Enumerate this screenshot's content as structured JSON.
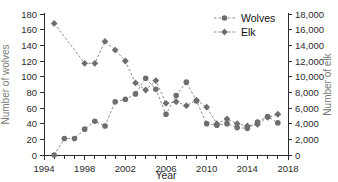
{
  "chart_data": {
    "type": "line",
    "title": "",
    "xlabel": "Year",
    "ylabel": "Number of wolves",
    "y2label": "Number of elk",
    "xlim": [
      1994,
      2018
    ],
    "ylim": [
      0,
      180
    ],
    "y2lim": [
      0,
      18000
    ],
    "xticks": [
      1994,
      1998,
      2002,
      2006,
      2010,
      2014,
      2018
    ],
    "xtick_labels": [
      "1994",
      "1998",
      "2002",
      "2006",
      "2010",
      "2014",
      "2018"
    ],
    "x_minor_tick_interval": 1,
    "yticks": [
      0,
      20,
      40,
      60,
      80,
      100,
      120,
      140,
      160,
      180
    ],
    "ytick_labels": [
      "0",
      "20",
      "40",
      "60",
      "80",
      "100",
      "120",
      "140",
      "160",
      "180"
    ],
    "y2ticks": [
      0,
      2000,
      4000,
      6000,
      8000,
      10000,
      12000,
      14000,
      16000,
      18000
    ],
    "y2tick_labels": [
      "0",
      "2,000",
      "4,000",
      "6,000",
      "8,000",
      "10,000",
      "12,000",
      "14,000",
      "16,000",
      "18,000"
    ],
    "grid": false,
    "legend_position": "top-right",
    "marker_color": "#6e6e6e",
    "line_color": "#8c8c8c",
    "axis_color": "#2b2b2b",
    "axis_label_color": "#7a7a7a",
    "series": [
      {
        "name": "Wolves",
        "axis": "left",
        "marker": "circle",
        "linestyle": "dashed",
        "x": [
          1995,
          1996,
          1997,
          1998,
          1999,
          2000,
          2001,
          2002,
          2003,
          2004,
          2005,
          2006,
          2007,
          2008,
          2009,
          2010,
          2011,
          2012,
          2013,
          2014,
          2015,
          2016,
          2017
        ],
        "values": [
          0,
          21,
          21,
          33,
          43,
          37,
          68,
          71,
          78,
          98,
          84,
          52,
          76,
          93,
          69,
          40,
          38,
          40,
          35,
          34,
          42,
          49,
          41
        ]
      },
      {
        "name": "Elk",
        "axis": "right",
        "marker": "diamond",
        "linestyle": "dashed",
        "x": [
          1995,
          1998,
          1999,
          2000,
          2001,
          2002,
          2003,
          2004,
          2005,
          2006,
          2007,
          2008,
          2009,
          2010,
          2011,
          2012,
          2013,
          2014,
          2015,
          2016,
          2017
        ],
        "values": [
          16800,
          11700,
          11700,
          14500,
          13400,
          12000,
          9200,
          8300,
          9500,
          6600,
          6800,
          6300,
          7000,
          6100,
          4000,
          4600,
          4000,
          3700,
          3900,
          4800,
          5200
        ]
      }
    ]
  },
  "legend": {
    "entries": [
      {
        "label": "Wolves",
        "marker": "circle"
      },
      {
        "label": "Elk",
        "marker": "diamond"
      }
    ]
  }
}
